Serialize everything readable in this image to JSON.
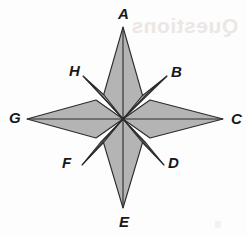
{
  "figure": {
    "name": "eight-pointed-compass-rose-star",
    "canvas": {
      "width": 247,
      "height": 236
    },
    "center": {
      "x": 123,
      "y": 119
    },
    "fill_color": "#b4b4b4",
    "stroke_color": "#2b2b2b",
    "background_color": "#fdfdfd",
    "label_color": "#17171a",
    "stroke_width": 1.1
  },
  "labels": [
    {
      "id": "A",
      "text": "A",
      "x": 118,
      "y": 6,
      "position": "north",
      "point_type": "long"
    },
    {
      "id": "B",
      "text": "B",
      "x": 171,
      "y": 64,
      "position": "northeast",
      "point_type": "short"
    },
    {
      "id": "C",
      "text": "C",
      "x": 231,
      "y": 111,
      "position": "east",
      "point_type": "long"
    },
    {
      "id": "D",
      "text": "D",
      "x": 168,
      "y": 155,
      "position": "southeast",
      "point_type": "short"
    },
    {
      "id": "E",
      "text": "E",
      "x": 119,
      "y": 214,
      "position": "south",
      "point_type": "long"
    },
    {
      "id": "F",
      "text": "F",
      "x": 62,
      "y": 155,
      "position": "southwest",
      "point_type": "short"
    },
    {
      "id": "G",
      "text": "G",
      "x": 9,
      "y": 110,
      "position": "west",
      "point_type": "long"
    },
    {
      "id": "H",
      "text": "H",
      "x": 69,
      "y": 63,
      "position": "northwest",
      "point_type": "short"
    }
  ],
  "tips": {
    "A": {
      "x": 123,
      "y": 27
    },
    "B": {
      "x": 167,
      "y": 76
    },
    "C": {
      "x": 223,
      "y": 119
    },
    "D": {
      "x": 164,
      "y": 165
    },
    "E": {
      "x": 123,
      "y": 208
    },
    "F": {
      "x": 82,
      "y": 165
    },
    "G": {
      "x": 27,
      "y": 119
    },
    "H": {
      "x": 83,
      "y": 76
    }
  },
  "polygons": {
    "north_point": "123,27 143,97 123,119 103,97",
    "south_point": "123,208 103,141 123,119 143,141",
    "west_point": "27,119 96,100 123,119 96,138",
    "east_point": "223,119 150,100 123,119 150,138",
    "northeast_point": "167,76 142,96 123,119 146,95",
    "southeast_point": "164,165 142,142 123,119 146,143",
    "southwest_point": "82,165 100,143 123,119 104,142",
    "northwest_point": "83,76 102,96 123,119 104,95"
  },
  "center_rays": [
    {
      "from": "center",
      "to": "A"
    },
    {
      "from": "center",
      "to": "B"
    },
    {
      "from": "center",
      "to": "C"
    },
    {
      "from": "center",
      "to": "D"
    },
    {
      "from": "center",
      "to": "E"
    },
    {
      "from": "center",
      "to": "F"
    },
    {
      "from": "center",
      "to": "G"
    },
    {
      "from": "center",
      "to": "H"
    }
  ],
  "watermark": {
    "text": "Questions",
    "note": "faint mirrored bleed-through from reverse of page"
  }
}
